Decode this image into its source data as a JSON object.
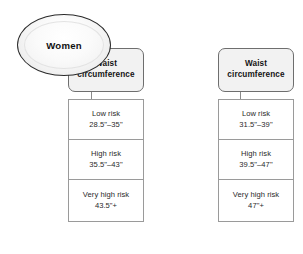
{
  "diagram": {
    "columns": [
      {
        "id": "women",
        "node_label": "Women",
        "header": {
          "line1": "Waist",
          "line2": "circumference"
        },
        "rows": [
          {
            "label": "Low risk",
            "value": "28.5\"–35\""
          },
          {
            "label": "High risk",
            "value": "35.5\"–43\""
          },
          {
            "label": "Very high risk",
            "value": "43.5\"+"
          }
        ]
      },
      {
        "id": "men",
        "node_label": "Men",
        "header": {
          "line1": "Waist",
          "line2": "circumference"
        },
        "rows": [
          {
            "label": "Low risk",
            "value": "31.5\"–39\""
          },
          {
            "label": "High risk",
            "value": "39.5\"–47\""
          },
          {
            "label": "Very high risk",
            "value": "47\"+"
          }
        ]
      }
    ]
  },
  "colors": {
    "background": "#ffffff",
    "node_outline": "#2b2b2b",
    "header_fill": "#f2f2f2",
    "header_outline": "#6e6e6e",
    "table_border": "#9a9a9a",
    "text": "#2a2a2a",
    "heading_text": "#141414",
    "connector": "#8a8a8a"
  }
}
